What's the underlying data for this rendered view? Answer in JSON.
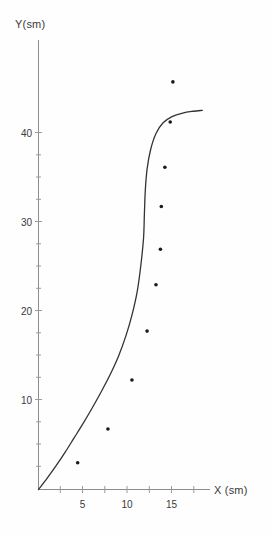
{
  "chart_data": {
    "type": "scatter",
    "title": "",
    "xlabel": "X (sm)",
    "ylabel": "Y(sm)",
    "xlim": [
      0,
      19
    ],
    "ylim": [
      0,
      48
    ],
    "xticks": [
      5,
      10,
      15
    ],
    "xtick_labels": [
      "5",
      "10",
      "15"
    ],
    "yticks": [
      10,
      20,
      30,
      40
    ],
    "ytick_labels": [
      "10",
      "20",
      "30",
      "40"
    ],
    "grid": false,
    "legend": "none",
    "series": [
      {
        "name": "data points",
        "marker": "dot",
        "color": "#1a1a1a",
        "points": [
          {
            "x": 4.4,
            "y": 3.0
          },
          {
            "x": 7.8,
            "y": 6.8
          },
          {
            "x": 10.5,
            "y": 12.3
          },
          {
            "x": 12.2,
            "y": 17.8
          },
          {
            "x": 13.2,
            "y": 23.0
          },
          {
            "x": 13.7,
            "y": 27.0
          },
          {
            "x": 13.8,
            "y": 31.8
          },
          {
            "x": 14.2,
            "y": 36.2
          },
          {
            "x": 14.8,
            "y": 41.3
          },
          {
            "x": 15.1,
            "y": 45.8
          }
        ]
      },
      {
        "name": "fitted curve",
        "marker": "line",
        "color": "#333333",
        "points": [
          {
            "x": 0.0,
            "y": 0.0
          },
          {
            "x": 1.0,
            "y": 1.3
          },
          {
            "x": 2.0,
            "y": 2.7
          },
          {
            "x": 3.0,
            "y": 4.2
          },
          {
            "x": 4.0,
            "y": 5.8
          },
          {
            "x": 5.0,
            "y": 7.4
          },
          {
            "x": 6.0,
            "y": 9.1
          },
          {
            "x": 7.0,
            "y": 10.9
          },
          {
            "x": 8.0,
            "y": 12.8
          },
          {
            "x": 9.0,
            "y": 15.0
          },
          {
            "x": 9.8,
            "y": 17.2
          },
          {
            "x": 10.5,
            "y": 19.6
          },
          {
            "x": 11.1,
            "y": 22.3
          },
          {
            "x": 11.5,
            "y": 25.2
          },
          {
            "x": 11.8,
            "y": 28.2
          },
          {
            "x": 11.9,
            "y": 31.0
          },
          {
            "x": 12.0,
            "y": 33.6
          },
          {
            "x": 12.2,
            "y": 36.0
          },
          {
            "x": 12.6,
            "y": 38.2
          },
          {
            "x": 13.2,
            "y": 40.0
          },
          {
            "x": 14.0,
            "y": 41.2
          },
          {
            "x": 15.0,
            "y": 41.9
          },
          {
            "x": 16.2,
            "y": 42.3
          },
          {
            "x": 17.4,
            "y": 42.5
          },
          {
            "x": 18.4,
            "y": 42.6
          }
        ]
      }
    ]
  },
  "axes": {
    "y_title": "Y(sm)",
    "x_title": "X (sm)"
  },
  "ticks": {
    "x": [
      "5",
      "10",
      "15"
    ],
    "y": [
      "40",
      "30",
      "20",
      "10"
    ]
  }
}
